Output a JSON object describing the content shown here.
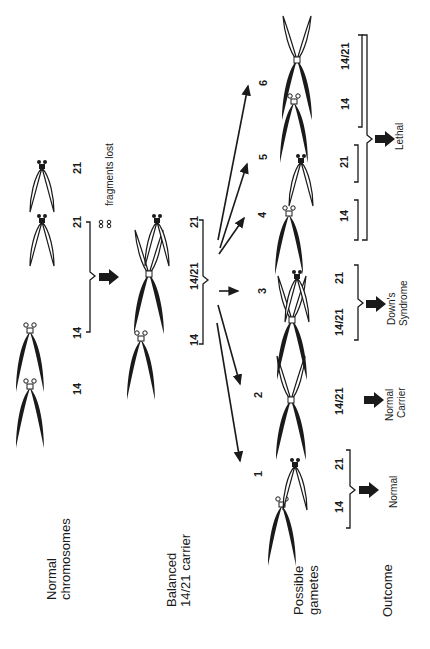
{
  "rows": {
    "normal": "Normal",
    "normal2": "chromosomes",
    "balanced": "Balanced",
    "balanced2": "14/21 carrier",
    "gametes": "Possible",
    "gametes2": "gametes",
    "outcome": "Outcome"
  },
  "normal_chromosomes": {
    "c1": "14",
    "c2": "14",
    "c3": "21",
    "c4": "21",
    "fragments": "fragments lost"
  },
  "carrier": {
    "c1": "14",
    "c2": "14/21",
    "c3": "21"
  },
  "gametes": [
    {
      "step": "1",
      "chromosomes": [
        "14",
        "21"
      ],
      "outcome": "Normal"
    },
    {
      "step": "2",
      "chromosomes": [
        "14/21"
      ],
      "outcome": "Normal Carrier",
      "outcome1": "Normal",
      "outcome2": "Carrier"
    },
    {
      "step": "3",
      "chromosomes": [
        "14/21",
        "21"
      ],
      "outcome": "Down's Syndrome",
      "outcome1": "Down's",
      "outcome2": "Syndrome"
    },
    {
      "step": "4",
      "chromosomes": [
        "14"
      ]
    },
    {
      "step": "5",
      "chromosomes": [
        "21"
      ]
    },
    {
      "step": "6",
      "chromosomes": [
        "14",
        "14/21"
      ]
    }
  ],
  "lethal_outcome": "Lethal",
  "colors": {
    "ink": "#1a1a1a",
    "background": "#ffffff"
  }
}
